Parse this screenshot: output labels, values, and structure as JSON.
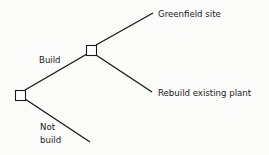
{
  "diagram": {
    "type": "decision-tree",
    "nodes": [
      {
        "id": "root",
        "kind": "decision"
      },
      {
        "id": "build-decision",
        "kind": "decision"
      }
    ],
    "edges": [
      {
        "from": "root",
        "to": "build-decision",
        "label": "Build"
      },
      {
        "from": "root",
        "to": "end-not-build",
        "label_lines": [
          "Not",
          "build"
        ]
      },
      {
        "from": "build-decision",
        "to": "end-greenfield",
        "label": ""
      },
      {
        "from": "build-decision",
        "to": "end-rebuild",
        "label": ""
      }
    ],
    "labels": {
      "build": "Build",
      "not_build_line1": "Not",
      "not_build_line2": "build",
      "greenfield": "Greenfield site",
      "rebuild": "Rebuild existing plant"
    },
    "colors": {
      "line": "#1a1a1a",
      "background": "#fbfbfa"
    }
  }
}
